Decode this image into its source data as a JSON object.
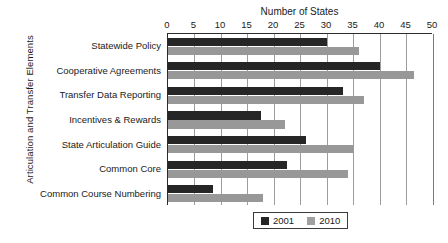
{
  "chart_data": {
    "type": "bar",
    "orientation": "horizontal",
    "title": "",
    "xlabel": "Number of States",
    "ylabel": "Articulation and Transfer Elements",
    "xlim": [
      0,
      50
    ],
    "xticks": [
      0,
      5,
      10,
      15,
      20,
      25,
      30,
      35,
      40,
      45,
      50
    ],
    "grid": true,
    "legend_position": "bottom-right",
    "categories": [
      "Statewide Policy",
      "Cooperative Agreements",
      "Transfer Data Reporting",
      "Incentives & Rewards",
      "State Articulation Guide",
      "Common Core",
      "Common Course Numbering"
    ],
    "series": [
      {
        "name": "2001",
        "color": "#262626",
        "values": [
          30,
          40,
          33,
          17.5,
          26,
          22.5,
          8.5
        ]
      },
      {
        "name": "2010",
        "color": "#989898",
        "values": [
          36,
          46.5,
          37,
          22,
          35,
          34,
          18
        ]
      }
    ]
  },
  "legend": {
    "items": [
      {
        "label": "2001"
      },
      {
        "label": "2010"
      }
    ]
  }
}
